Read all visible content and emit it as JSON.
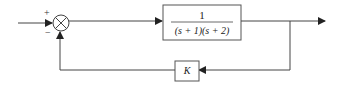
{
  "diagram": {
    "type": "feedback-control-block-diagram",
    "summing_junction": {
      "plus_sign": "+",
      "minus_sign": "−"
    },
    "forward_block": {
      "numerator": "1",
      "denominator": "(s + 1)(s + 2)"
    },
    "feedback_block": {
      "label": "K"
    },
    "colors": {
      "line": "#444444",
      "background": "#ffffff"
    }
  }
}
